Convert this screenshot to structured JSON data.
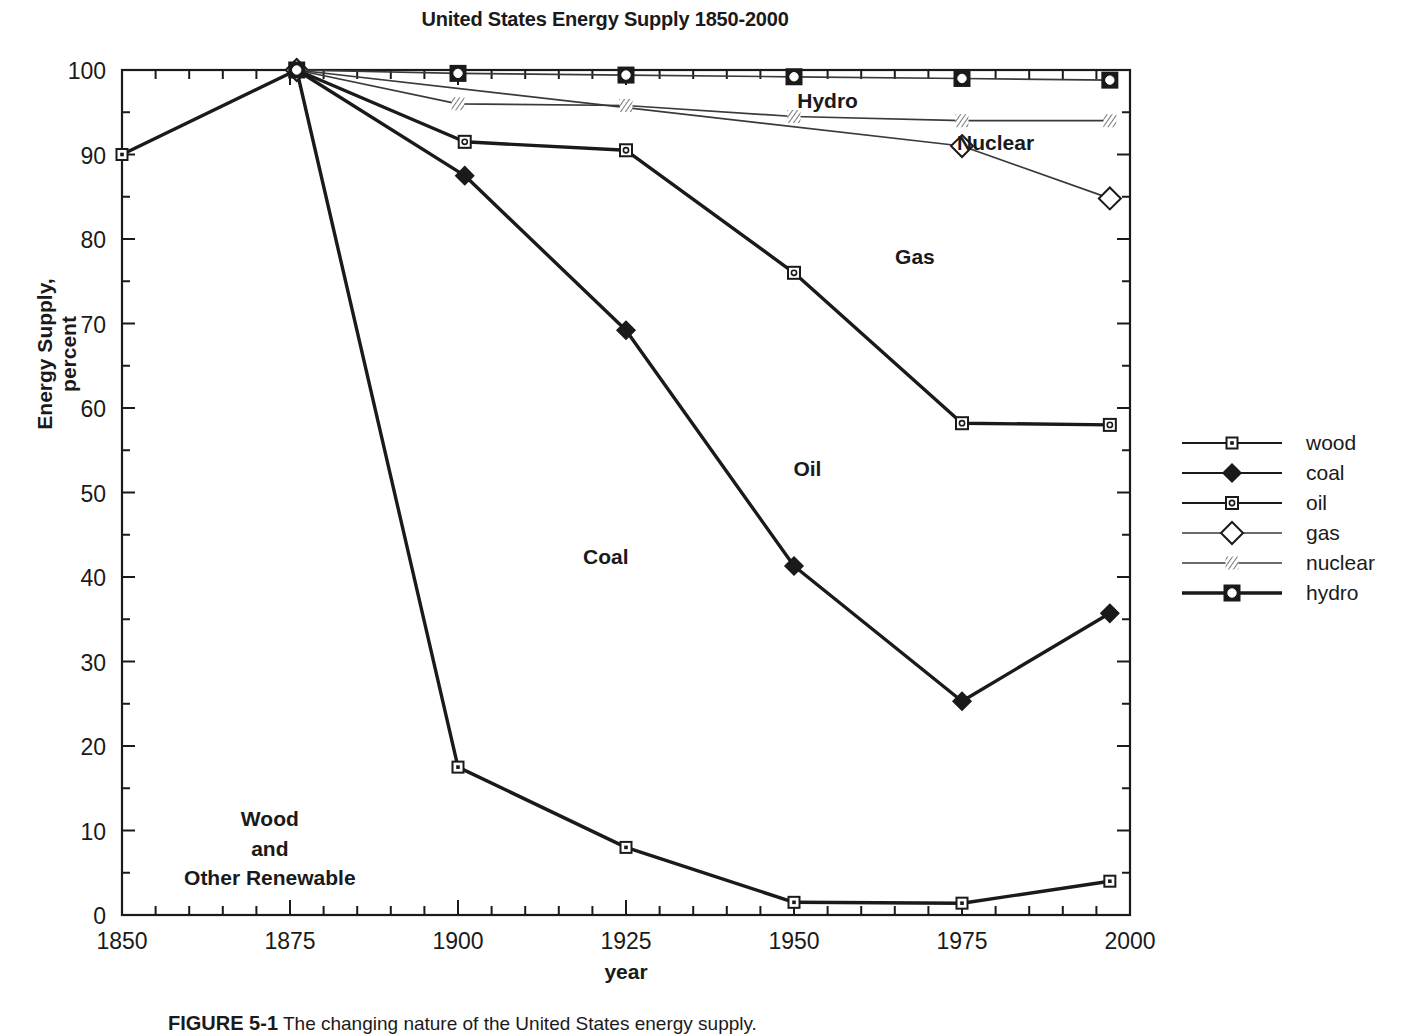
{
  "chart_data": {
    "type": "line",
    "title": "United States Energy Supply 1850-2000",
    "xlabel": "year",
    "ylabel": "Energy Supply, percent",
    "xlim": [
      1850,
      2000
    ],
    "ylim": [
      0,
      100
    ],
    "grid": false,
    "x_major_ticks": [
      1850,
      1875,
      1900,
      1925,
      1950,
      1975,
      2000
    ],
    "x_tick_labels": [
      "1850",
      "1875",
      "1900",
      "1925",
      "1950",
      "1975",
      "2000"
    ],
    "x_minor_step": 5,
    "y_major_ticks": [
      0,
      10,
      20,
      30,
      40,
      50,
      60,
      70,
      80,
      90,
      100
    ],
    "y_tick_labels": [
      "0",
      "10",
      "20",
      "30",
      "40",
      "50",
      "60",
      "70",
      "80",
      "90",
      "100"
    ],
    "y_minor_step": 5,
    "legend_position": "right-outside",
    "series": [
      {
        "name": "wood",
        "marker": "square-dot",
        "line_weight": "bold",
        "x": [
          1850,
          1876,
          1900,
          1925,
          1950,
          1975,
          1997
        ],
        "values": [
          90.0,
          100.0,
          17.5,
          8.0,
          1.5,
          1.4,
          4.0
        ]
      },
      {
        "name": "coal",
        "marker": "filled-diamond",
        "line_weight": "bold",
        "x": [
          1876,
          1901,
          1925,
          1950,
          1975,
          1997
        ],
        "values": [
          100.0,
          87.5,
          69.2,
          41.3,
          25.3,
          35.7
        ]
      },
      {
        "name": "oil",
        "marker": "square-circle-small",
        "line_weight": "bold",
        "x": [
          1876,
          1901,
          1925,
          1950,
          1975,
          1997
        ],
        "values": [
          100.0,
          91.5,
          90.5,
          76.0,
          58.2,
          58.0
        ]
      },
      {
        "name": "gas",
        "marker": "open-diamond",
        "line_weight": "thin",
        "x": [
          1876,
          1975,
          1997
        ],
        "values": [
          100.0,
          91.0,
          84.8
        ]
      },
      {
        "name": "nuclear",
        "marker": "hatched",
        "line_weight": "thin",
        "x": [
          1876,
          1900,
          1925,
          1950,
          1975,
          1997
        ],
        "values": [
          100.0,
          96.0,
          95.8,
          94.5,
          94.0,
          94.0
        ]
      },
      {
        "name": "hydro",
        "marker": "square-circle",
        "line_weight": "thin",
        "x": [
          1876,
          1900,
          1925,
          1950,
          1975,
          1997
        ],
        "values": [
          100.0,
          99.6,
          99.4,
          99.2,
          99.0,
          98.8
        ]
      }
    ],
    "annotations": [
      {
        "text": "Hydro",
        "x": 1955,
        "y": 95.5
      },
      {
        "text": "Nuclear",
        "x": 1980,
        "y": 90.5
      },
      {
        "text": "Gas",
        "x": 1968,
        "y": 77.0
      },
      {
        "text": "Oil",
        "x": 1952,
        "y": 52.0
      },
      {
        "text": "Coal",
        "x": 1922,
        "y": 41.5
      },
      {
        "text": "Wood",
        "x": 1872,
        "y": 10.5
      },
      {
        "text": "and",
        "x": 1872,
        "y": 7.0
      },
      {
        "text": "Other Renewable",
        "x": 1872,
        "y": 3.6
      }
    ]
  },
  "legend": {
    "items": [
      {
        "label": "wood",
        "marker": "square-dot"
      },
      {
        "label": "coal",
        "marker": "filled-diamond"
      },
      {
        "label": "oil",
        "marker": "square-circle-small"
      },
      {
        "label": "gas",
        "marker": "open-diamond"
      },
      {
        "label": "nuclear",
        "marker": "hatched"
      },
      {
        "label": "hydro",
        "marker": "square-circle"
      }
    ]
  },
  "caption": {
    "number": "FIGURE 5-1",
    "text": "The changing nature of the United States energy supply."
  },
  "colors": {
    "line": "#1a1a1a",
    "thin_line": "#3a3a3a",
    "background": "#ffffff",
    "text": "#1a1a1a"
  }
}
